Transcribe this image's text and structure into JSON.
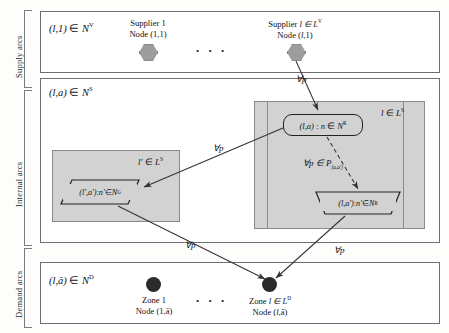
{
  "figure": {
    "side_labels": [
      {
        "text": "Supply arcs"
      },
      {
        "text": "Internal arcs"
      },
      {
        "text": "Demand arcs"
      }
    ],
    "bands": {
      "supply": {
        "title_prefix": "(l,1) ",
        "title_member": "∈ ",
        "title_set": "N",
        "title_sup": "V",
        "nodes": [
          {
            "line1_label": "Supplier ",
            "line1_index": "1",
            "line2_prefix": "Node (",
            "line2_index": "1",
            "line2_suffix": ",1)"
          },
          {
            "line1_label": "Supplier ",
            "line1_index": "l ∈ L",
            "line1_sup": "V",
            "line2_prefix": "Node (",
            "line2_index": "l",
            "line2_suffix": ",1)"
          }
        ],
        "ellipsis": ". . ."
      },
      "internal": {
        "title_prefix": "(l,a) ",
        "title_member": "∈ ",
        "title_set": "N",
        "title_sup": "S",
        "left_panel_tag_prefix": "l'",
        "left_panel_tag_member": " ∈ ",
        "left_panel_tag_set": "L",
        "left_panel_tag_sup": "S",
        "right_panel_tag_prefix": "l",
        "right_panel_tag_member": " ∈ ",
        "right_panel_tag_set": "L",
        "right_panel_tag_sup": "S",
        "node_rrect": {
          "pair": "(l,a)",
          "sep": " : ",
          "var": "n",
          "member": " ∈ ",
          "set": "N",
          "sup": "R"
        },
        "node_trap": {
          "pair": "(l,a')",
          "sep": " : ",
          "var": "n'",
          "member": " ∈ ",
          "set": "N",
          "sup": "R"
        },
        "node_para": {
          "pair": "(l',a')",
          "sep": " : ",
          "var": "n'",
          "member": " ∈ ",
          "set": "N",
          "sup": "G"
        }
      },
      "demand": {
        "title_prefix": "(l,ā) ",
        "title_member": "∈ ",
        "title_set": "N",
        "title_sup": "D",
        "nodes": [
          {
            "line1_label": "Zone ",
            "line1_index": "1",
            "line2_prefix": "Node (",
            "line2_index": "1",
            "line2_suffix": ",ā)"
          },
          {
            "line1_label": "Zone ",
            "line1_index": "l ∈ L",
            "line1_sup": "D",
            "line2_prefix": "Node (",
            "line2_index": "l",
            "line2_suffix": ",ā)"
          }
        ],
        "ellipsis": ". . ."
      }
    },
    "arrow_labels": [
      {
        "id": "supply-arc-label",
        "text": "∀p"
      },
      {
        "id": "internal-cross-arc-label",
        "text": "∀p"
      },
      {
        "id": "internal-path-arc-label",
        "prefix": "∀p ∈ P",
        "sub": "(a,a')"
      },
      {
        "id": "demand-arc-left-label",
        "text": "∀p"
      },
      {
        "id": "demand-arc-right-label",
        "text": "∀p"
      }
    ],
    "colors": {
      "panel_gray": "#d2d2d2",
      "node_gray": "#9d9d9d",
      "dot_black": "#2b2b2b",
      "line": "#333333",
      "border": "#6e6e6e"
    }
  }
}
